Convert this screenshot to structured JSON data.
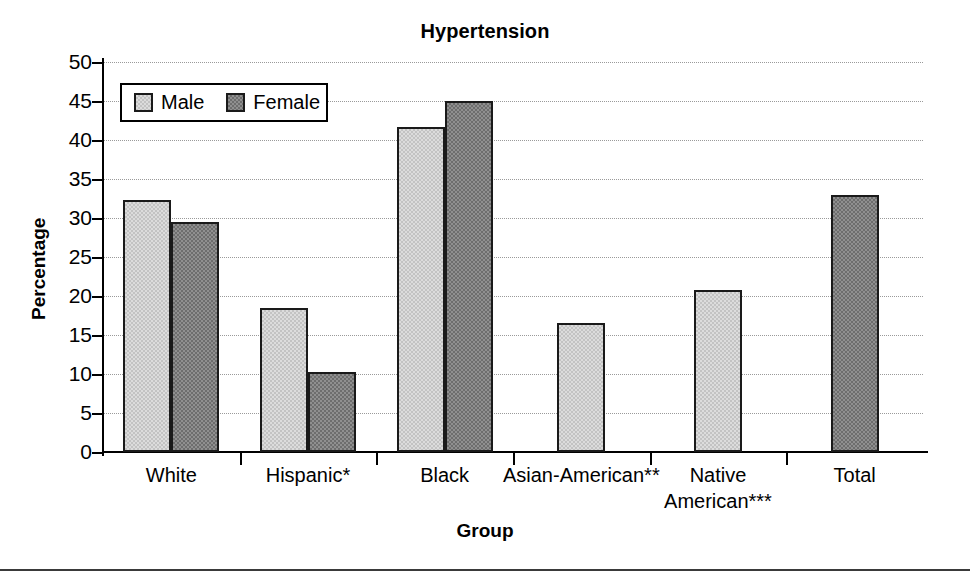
{
  "chart_data": {
    "type": "bar",
    "title": "Hypertension",
    "xlabel": "Group",
    "ylabel": "Percentage",
    "ylim": [
      0,
      50
    ],
    "yticks": [
      0,
      5,
      10,
      15,
      20,
      25,
      30,
      35,
      40,
      45,
      50
    ],
    "grid": true,
    "legend_position": "upper-left-inside",
    "categories": [
      "White",
      "Hispanic*",
      "Black",
      "Asian-American**",
      "Native American***",
      "Total"
    ],
    "category_lines": [
      [
        "White"
      ],
      [
        "Hispanic*"
      ],
      [
        "Black"
      ],
      [
        "Asian-American**"
      ],
      [
        "Native",
        "American***"
      ],
      [
        "Total"
      ]
    ],
    "series": [
      {
        "name": "Male",
        "values": [
          32.3,
          18.5,
          41.7,
          16.5,
          20.8,
          null
        ]
      },
      {
        "name": "Female",
        "values": [
          29.5,
          10.3,
          45.0,
          null,
          null,
          33.0
        ]
      }
    ],
    "colors": {
      "male_fill": "#dcdcdc",
      "female_fill": "#8f8f8f",
      "bar_outline": "#1a1a1a",
      "gridline": "#9a9a9a",
      "axis": "#000000",
      "background": "#ffffff"
    }
  },
  "legend": {
    "items": [
      {
        "label": "Male"
      },
      {
        "label": "Female"
      }
    ]
  }
}
